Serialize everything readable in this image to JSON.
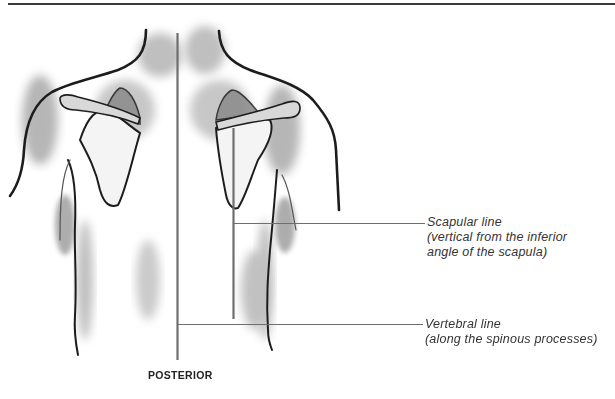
{
  "figure": {
    "view_label": "POSTERIOR",
    "annotations": [
      {
        "id": "scapular-line",
        "title": "Scapular line",
        "description_line1": "(vertical from the inferior",
        "description_line2": "angle of the scapula)"
      },
      {
        "id": "vertebral-line",
        "title": "Vertebral line",
        "description_line1": "(along the spinous processes)"
      }
    ],
    "colors": {
      "line": "#6e6e6e",
      "outline": "#1e1e1e",
      "shade": "#9a9a9a",
      "background": "#ffffff"
    }
  }
}
